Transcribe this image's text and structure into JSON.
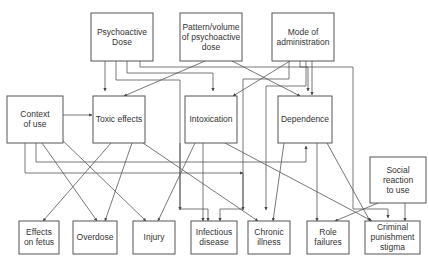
{
  "diagram": {
    "nodes": [
      {
        "id": "psychoactive-dose",
        "lines": [
          "Psychoactive",
          "Dose"
        ]
      },
      {
        "id": "pattern-volume",
        "lines": [
          "Pattern/volume",
          "of psychoactive",
          "dose"
        ]
      },
      {
        "id": "mode-admin",
        "lines": [
          "Mode of",
          "administration"
        ]
      },
      {
        "id": "context-of-use",
        "lines": [
          "Context",
          "of use"
        ]
      },
      {
        "id": "toxic-effects",
        "lines": [
          "Toxic effects"
        ]
      },
      {
        "id": "intoxication",
        "lines": [
          "Intoxication"
        ]
      },
      {
        "id": "dependence",
        "lines": [
          "Dependence"
        ]
      },
      {
        "id": "social-reaction",
        "lines": [
          "Social",
          "reaction",
          "to use"
        ]
      },
      {
        "id": "effects-on-fetus",
        "lines": [
          "Effects",
          "on fetus"
        ]
      },
      {
        "id": "overdose",
        "lines": [
          "Overdose"
        ]
      },
      {
        "id": "injury",
        "lines": [
          "Injury"
        ]
      },
      {
        "id": "infectious-disease",
        "lines": [
          "Infectious",
          "disease"
        ]
      },
      {
        "id": "chronic-illness",
        "lines": [
          "Chronic",
          "illness"
        ]
      },
      {
        "id": "role-failures",
        "lines": [
          "Role",
          "failures"
        ]
      },
      {
        "id": "criminal-punishment",
        "lines": [
          "Criminal",
          "punishment",
          "stigma"
        ]
      }
    ],
    "edges": [
      {
        "from": "psychoactive-dose",
        "to": "toxic-effects"
      },
      {
        "from": "psychoactive-dose",
        "to": "intoxication"
      },
      {
        "from": "psychoactive-dose",
        "to": "dependence"
      },
      {
        "from": "psychoactive-dose",
        "to": "chronic-illness"
      },
      {
        "from": "pattern-volume",
        "to": "toxic-effects"
      },
      {
        "from": "pattern-volume",
        "to": "dependence"
      },
      {
        "from": "mode-admin",
        "to": "intoxication"
      },
      {
        "from": "mode-admin",
        "to": "dependence"
      },
      {
        "from": "mode-admin",
        "to": "infectious-disease"
      },
      {
        "from": "mode-admin",
        "to": "chronic-illness"
      },
      {
        "from": "mode-admin",
        "to": "criminal-punishment"
      },
      {
        "from": "context-of-use",
        "to": "toxic-effects"
      },
      {
        "from": "context-of-use",
        "to": "intoxication"
      },
      {
        "from": "context-of-use",
        "to": "dependence"
      },
      {
        "from": "context-of-use",
        "to": "overdose"
      },
      {
        "from": "context-of-use",
        "to": "injury"
      },
      {
        "from": "toxic-effects",
        "to": "effects-on-fetus"
      },
      {
        "from": "toxic-effects",
        "to": "overdose"
      },
      {
        "from": "toxic-effects",
        "to": "chronic-illness"
      },
      {
        "from": "intoxication",
        "to": "injury"
      },
      {
        "from": "intoxication",
        "to": "infectious-disease"
      },
      {
        "from": "intoxication",
        "to": "criminal-punishment"
      },
      {
        "from": "dependence",
        "to": "chronic-illness"
      },
      {
        "from": "dependence",
        "to": "role-failures"
      },
      {
        "from": "dependence",
        "to": "criminal-punishment"
      },
      {
        "from": "social-reaction",
        "to": "role-failures"
      },
      {
        "from": "social-reaction",
        "to": "criminal-punishment"
      }
    ]
  }
}
